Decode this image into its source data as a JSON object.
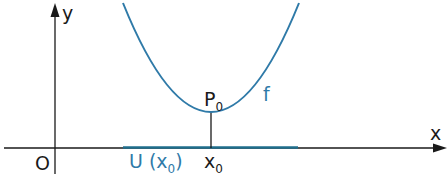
{
  "diagram": {
    "type": "function-graph",
    "colors": {
      "axes": "#1a1a1a",
      "curve": "#2f7aa8",
      "interval": "#1f6e8c",
      "labels_blue": "#2f7aa8"
    },
    "axes": {
      "x_label": "x",
      "y_label": "y",
      "origin_label": "O"
    },
    "curve": {
      "name": "f",
      "shape": "upward parabola with minimum at P0"
    },
    "point": {
      "name": "P",
      "subscript": "0"
    },
    "x_marker": {
      "name": "x",
      "subscript": "0"
    },
    "neighborhood": {
      "prefix": "U (x",
      "subscript": "0",
      "suffix": ")"
    }
  }
}
